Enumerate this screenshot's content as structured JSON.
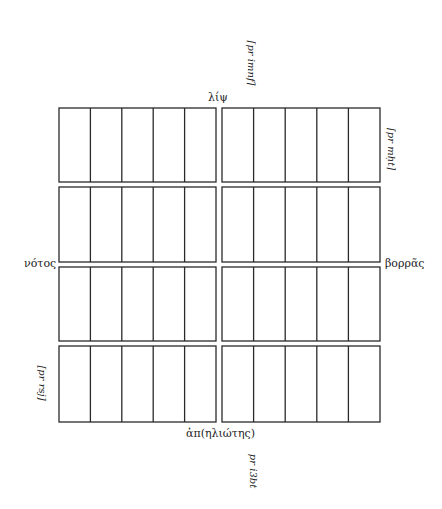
{
  "diagram": {
    "type": "grid-plan",
    "grid": {
      "left": 59,
      "right": 380,
      "top": 108,
      "bottom": 422,
      "rows": 4,
      "cols_per_half": 5,
      "center_gap": [
        216,
        222
      ],
      "row_gaps": [
        [
          182,
          187
        ],
        [
          262,
          267
        ],
        [
          341,
          346
        ]
      ],
      "stroke_color": "#2a2a2a",
      "stroke_width": 1.3
    }
  },
  "labels": {
    "top": "λίψ",
    "bottom": "ἀπ(ηλιώτης)",
    "left": "νότος",
    "right": "βορρᾶς",
    "annotation_top": "⌈pr imnf⌉",
    "annotation_top_right": "⌈pr mḥt⌉",
    "annotation_bottom_left": "[pr rsj]",
    "annotation_bottom": "pr i3bt"
  }
}
